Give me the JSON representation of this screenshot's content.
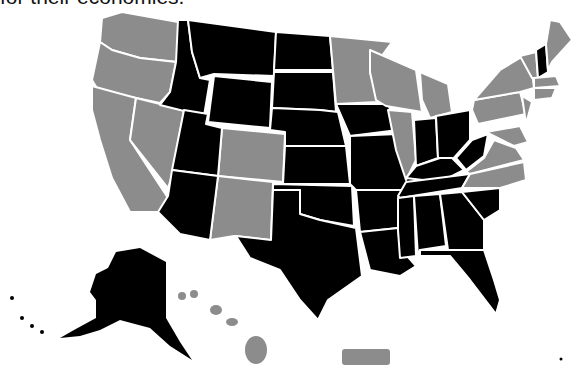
{
  "caption": "for their economies.",
  "colors": {
    "category_a": "#000000",
    "category_b": "#8c8c8c",
    "border": "#ffffff",
    "background": "#ffffff"
  },
  "map": {
    "title": "United States map — states shaded in two categories",
    "black_states": [
      "Idaho",
      "Montana",
      "Wyoming",
      "Utah",
      "Arizona",
      "North Dakota",
      "South Dakota",
      "Nebraska",
      "Kansas",
      "Oklahoma",
      "Texas",
      "Iowa",
      "Missouri",
      "Arkansas",
      "Louisiana",
      "Indiana",
      "Ohio",
      "Kentucky",
      "West Virginia",
      "Tennessee",
      "Mississippi",
      "Alabama",
      "Georgia",
      "South Carolina",
      "Florida",
      "New Hampshire",
      "Alaska"
    ],
    "gray_states": [
      "Washington",
      "Oregon",
      "California",
      "Nevada",
      "Colorado",
      "New Mexico",
      "Minnesota",
      "Wisconsin",
      "Michigan",
      "Illinois",
      "Pennsylvania",
      "New York",
      "Vermont",
      "Maine",
      "Massachusetts",
      "Connecticut",
      "Rhode Island",
      "New Jersey",
      "Delaware",
      "Maryland",
      "Virginia",
      "North Carolina",
      "Hawaii",
      "Puerto Rico"
    ]
  }
}
